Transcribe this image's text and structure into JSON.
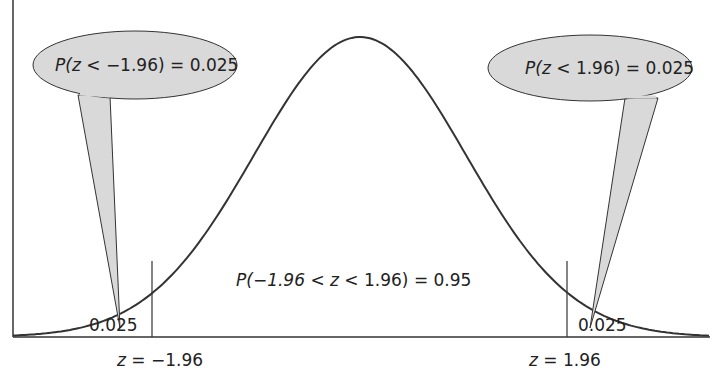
{
  "diagram": {
    "callouts": {
      "left": {
        "prefix": "P(",
        "var": "z",
        "text": " < −1.96) = 0.025"
      },
      "right": {
        "prefix": "P(",
        "var": "z",
        "text": " < 1.96) = 0.025"
      }
    },
    "center_label": {
      "prefix": "P(−1.96 < ",
      "var": "z",
      "text": " < 1.96) = 0.95"
    },
    "tail_areas": {
      "left": "0.025",
      "right": "0.025"
    },
    "axis_labels": {
      "left": {
        "var": "z",
        "text": " = −1.96"
      },
      "right": {
        "var": "z",
        "text": " = 1.96"
      }
    },
    "colors": {
      "curve": "#333333",
      "callout_fill": "#d9d9d9",
      "callout_stroke": "#333333"
    }
  }
}
